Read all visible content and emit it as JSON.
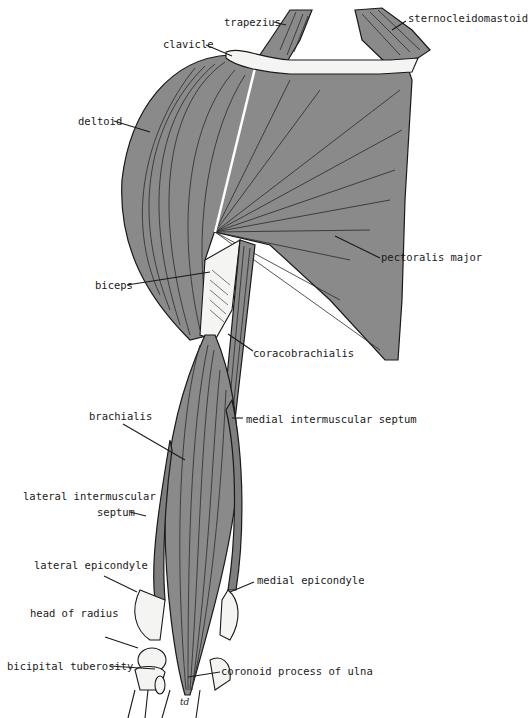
{
  "figure": {
    "colors": {
      "muscle": "#8a8a8a",
      "bone": "#f4f4f2",
      "outline": "#1a1a1a",
      "background": "#ffffff"
    },
    "signature": "td"
  },
  "labels": {
    "trapezius": "trapezius",
    "sternocleidomastoid": "sternocleidomastoid",
    "clavicle": "clavicle",
    "deltoid": "deltoid",
    "pectoralis_major": "pectoralis major",
    "biceps": "biceps",
    "coracobrachialis": "coracobrachialis",
    "medial_intermuscular_septum": "medial intermuscular septum",
    "brachialis": "brachialis",
    "lateral_intermuscular_septum_line1": "lateral intermuscular",
    "lateral_intermuscular_septum_line2": "septum",
    "lateral_epicondyle": "lateral epicondyle",
    "medial_epicondyle": "medial epicondyle",
    "head_of_radius": "head of radius",
    "bicipital_tuberosity": "bicipital tuberosity",
    "coronoid_process_of_ulna": "coronoid process of ulna"
  }
}
